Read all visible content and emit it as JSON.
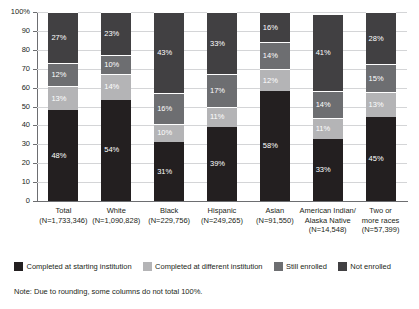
{
  "chart_data": {
    "type": "bar",
    "subtype": "stacked-bar-100",
    "title": "",
    "xlabel": "",
    "ylabel": "",
    "ylim": [
      0,
      100
    ],
    "yticks": [
      "0",
      "10",
      "20",
      "30",
      "40",
      "50",
      "60",
      "70",
      "80",
      "90",
      "100%"
    ],
    "grid": true,
    "legend_position": "bottom",
    "categories": [
      "Total",
      "White",
      "Black",
      "Hispanic",
      "Asian",
      "American Indian/ Alaska Native",
      "Two or more races"
    ],
    "category_labels": [
      {
        "name": "Total",
        "n": "(N=1,733,346)"
      },
      {
        "name": "White",
        "n": "(N=1,090,828)"
      },
      {
        "name": "Black",
        "n": "(N=229,756)"
      },
      {
        "name": "Hispanic",
        "n": "(N=249,265)"
      },
      {
        "name": "Asian",
        "n": "(N=91,550)"
      },
      {
        "name": "American Indian/\nAlaska Native",
        "n": "(N=14,548)"
      },
      {
        "name": "Two or\nmore races",
        "n": "(N=57,399)"
      }
    ],
    "series": [
      {
        "name": "Completed at starting institution",
        "color": "#231f20",
        "values": [
          48,
          54,
          31,
          39,
          58,
          33,
          45
        ],
        "labels": [
          "48%",
          "54%",
          "31%",
          "39%",
          "58%",
          "33%",
          "45%"
        ]
      },
      {
        "name": "Completed at different institution",
        "color": "#b4b4b6",
        "values": [
          13,
          14,
          10,
          11,
          12,
          11,
          13
        ],
        "labels": [
          "13%",
          "14%",
          "10%",
          "11%",
          "12%",
          "11%",
          "13%"
        ]
      },
      {
        "name": "Still enrolled",
        "color": "#6d6e71",
        "values": [
          12,
          10,
          16,
          17,
          14,
          14,
          15
        ],
        "labels": [
          "12%",
          "10%",
          "16%",
          "17%",
          "14%",
          "14%",
          "15%"
        ]
      },
      {
        "name": "Not enrolled",
        "color": "#414042",
        "values": [
          27,
          23,
          43,
          33,
          16,
          41,
          28
        ],
        "labels": [
          "27%",
          "23%",
          "43%",
          "33%",
          "16%",
          "41%",
          "28%"
        ]
      }
    ]
  },
  "legend": {
    "items": [
      {
        "label": "Completed at starting institution",
        "color": "#231f20"
      },
      {
        "label": "Completed at different institution",
        "color": "#b4b4b6"
      },
      {
        "label": "Still enrolled",
        "color": "#6d6e71"
      },
      {
        "label": "Not enrolled",
        "color": "#414042"
      }
    ]
  },
  "note": {
    "text": "Note: Due to rounding, some columns do not total 100%."
  },
  "axis": {
    "y_top_label": "100%"
  }
}
